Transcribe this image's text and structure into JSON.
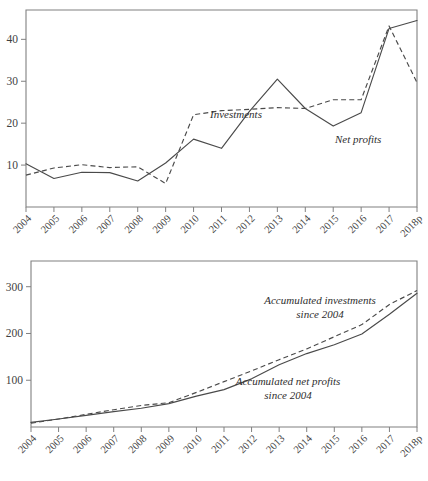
{
  "chart_data": [
    {
      "id": "top",
      "type": "line",
      "title": "",
      "xlabel": "",
      "ylabel": "",
      "categories": [
        "2004",
        "2005",
        "2006",
        "2007",
        "2008",
        "2009",
        "2010",
        "2011",
        "2012",
        "2013",
        "2014",
        "2015",
        "2016",
        "2017",
        "2018p"
      ],
      "yticks": [
        10,
        20,
        30,
        40
      ],
      "ylim": [
        0,
        47
      ],
      "grid": false,
      "legend_position": "inline-annotation",
      "series": [
        {
          "name": "Net profits",
          "style": "solid",
          "values": [
            10.3,
            6.8,
            8.3,
            8.2,
            6.2,
            10.5,
            16.2,
            14.0,
            22.8,
            30.5,
            23.5,
            19.3,
            22.5,
            42.6,
            44.5
          ]
        },
        {
          "name": "Investments",
          "style": "dashed",
          "values": [
            7.6,
            9.3,
            10.1,
            9.4,
            9.6,
            5.6,
            22.0,
            23.0,
            23.3,
            23.7,
            23.5,
            25.6,
            25.6,
            43.2,
            29.7
          ]
        }
      ],
      "annotations": [
        {
          "text": "Investments",
          "series": "Investments",
          "x": 210,
          "y": 118
        },
        {
          "text": "Net profits",
          "series": "Net profits",
          "x": 335,
          "y": 143
        }
      ]
    },
    {
      "id": "bottom",
      "type": "line",
      "title": "",
      "xlabel": "",
      "ylabel": "",
      "categories": [
        "2004",
        "2005",
        "2006",
        "2007",
        "2008",
        "2009",
        "2010",
        "2011",
        "2012",
        "2013",
        "2014",
        "2015",
        "2016",
        "2017",
        "2018p"
      ],
      "yticks": [
        100,
        200,
        300
      ],
      "ylim": [
        0,
        355
      ],
      "grid": false,
      "legend_position": "inline-annotation",
      "series": [
        {
          "name": "Accumulated net profits since 2004",
          "style": "solid",
          "values": [
            10,
            17,
            25,
            33,
            40,
            50,
            66,
            80,
            103,
            133,
            157,
            176,
            199,
            241,
            286
          ]
        },
        {
          "name": "Accumulated investments since 2004",
          "style": "dashed",
          "values": [
            8,
            17,
            27,
            37,
            46,
            52,
            74,
            97,
            120,
            144,
            167,
            193,
            219,
            262,
            292
          ]
        }
      ],
      "annotations": [
        {
          "text_line1": "Accumulated investments",
          "text_line2": "since 2004",
          "series": "Accumulated investments since 2004",
          "x": 320,
          "y": 304
        },
        {
          "text_line1": "Accumulated net profits",
          "text_line2": "since 2004",
          "series": "Accumulated net profits since 2004",
          "x": 288,
          "y": 385
        }
      ]
    }
  ],
  "colors": {
    "line": "#4a4a4a",
    "axis": "#808080",
    "text": "#3a3a3a",
    "background": "#ffffff"
  },
  "annotations_flat": {
    "top_investments": "Investments",
    "top_net_profits": "Net profits",
    "bottom_acc_inv_l1": "Accumulated investments",
    "bottom_acc_inv_l2": "since 2004",
    "bottom_acc_np_l1": "Accumulated net profits",
    "bottom_acc_np_l2": "since 2004"
  }
}
